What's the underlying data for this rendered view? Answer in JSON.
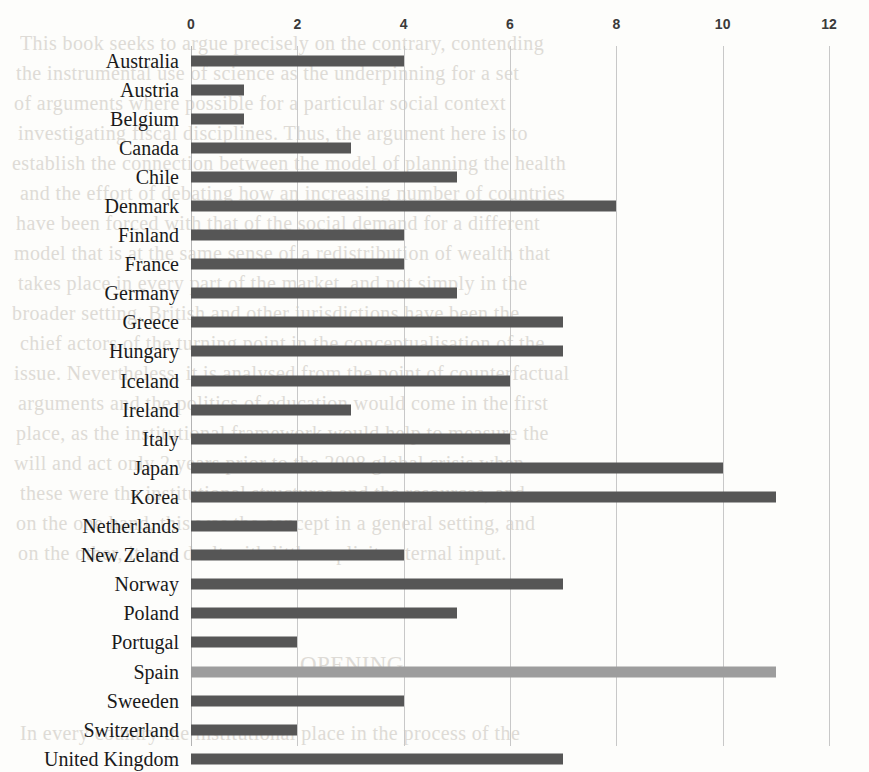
{
  "chart_data": {
    "type": "bar",
    "orientation": "horizontal",
    "title": "",
    "subtitle": "",
    "xlabel": "",
    "ylabel": "",
    "xlim": [
      0,
      12
    ],
    "xticks": [
      0,
      2,
      4,
      6,
      8,
      10,
      12
    ],
    "xtick_labels": [
      "0",
      "2",
      "4",
      "6",
      "8",
      "10",
      "12"
    ],
    "grid": true,
    "legend": "none",
    "highlight_category": "Spain",
    "colors": {
      "bar": "#565656",
      "highlight_bar": "#9d9d9d",
      "gridline": "#c8c8c8",
      "axis": "#b4b4b4",
      "label_text": "#1a1a1a",
      "tick_text": "#3a3a3a",
      "background": "#fdfdfb"
    },
    "categories": [
      "Australia",
      "Austria",
      "Belgium",
      "Canada",
      "Chile",
      "Denmark",
      "Finland",
      "France",
      "Germany",
      "Greece",
      "Hungary",
      "Iceland",
      "Ireland",
      "Italy",
      "Japan",
      "Korea",
      "Netherlands",
      "New Zeland",
      "Norway",
      "Poland",
      "Portugal",
      "Spain",
      "Sweeden",
      "Switzerland",
      "United Kingdom",
      "United States"
    ],
    "values": [
      4,
      1,
      1,
      3,
      5,
      8,
      4,
      4,
      5,
      7,
      7,
      6,
      3,
      6,
      10,
      11,
      2,
      4,
      7,
      5,
      2,
      11,
      4,
      2,
      7,
      11
    ]
  },
  "background_text": {
    "lines": [
      "This book seeks to argue precisely on the contrary, contending",
      "the instrumental use of science as the underpinning for a set",
      "of arguments where possible for a particular social context",
      "investigating fiscal disciplines. Thus, the argument here is to",
      "establish the connection between the model of planning the health",
      "and the effort of debating how an increasing number of countries",
      "have been forced with that of the social demand for a different",
      "model that is at the same sense of a redistribution of wealth that",
      "takes place in every part of the market, and not simply in the",
      "broader setting. British and other jurisdictions have been the",
      "chief actors of the turning point in the conceptualisation of the",
      "issue. Nevertheless, it is analysed from the point of counterfactual",
      "arguments and the politics of education would come in the first",
      "place, as the institutional framework would help to measure the",
      "will and act only 2 years prior to the 2008 global crisis when",
      "these were the institutional structures and the resources, and",
      "on the one hand, this was the concept in a general setting, and",
      "on the other, it was dealt with little explicit external input.",
      "OPENING",
      "In every country the institutional place in the process of the"
    ]
  }
}
